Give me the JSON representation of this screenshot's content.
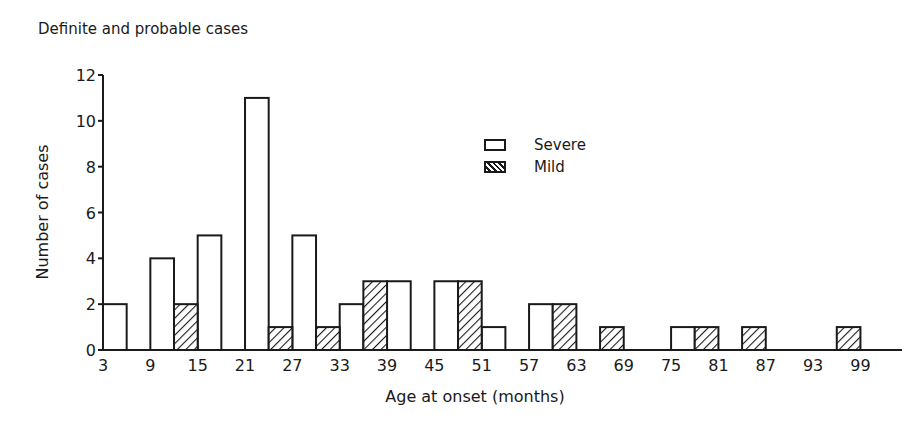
{
  "title": "Definite and probable cases",
  "chart_data": {
    "type": "bar",
    "title": "Definite and probable cases",
    "xlabel": "Age at onset (months)",
    "ylabel": "Number of cases",
    "ylim": [
      0,
      12
    ],
    "yticks": [
      0,
      2,
      4,
      6,
      8,
      10,
      12
    ],
    "xtick_labels": [
      "3",
      "9",
      "15",
      "21",
      "27",
      "33",
      "39",
      "45",
      "51",
      "57",
      "63",
      "69",
      "75",
      "81",
      "87",
      "93",
      "99"
    ],
    "grid": false,
    "legend_position": "upper-center-right",
    "bin_width_months": 3,
    "series": [
      {
        "name": "Severe",
        "pattern": "open",
        "bins": [
          {
            "age": 3,
            "value": 2
          },
          {
            "age": 9,
            "value": 4
          },
          {
            "age": 15,
            "value": 5
          },
          {
            "age": 21,
            "value": 11
          },
          {
            "age": 27,
            "value": 5
          },
          {
            "age": 33,
            "value": 2
          },
          {
            "age": 39,
            "value": 3
          },
          {
            "age": 45,
            "value": 3
          },
          {
            "age": 51,
            "value": 1
          },
          {
            "age": 57,
            "value": 2
          },
          {
            "age": 75,
            "value": 1
          }
        ]
      },
      {
        "name": "Mild",
        "pattern": "hatched",
        "bins": [
          {
            "age": 12,
            "value": 2
          },
          {
            "age": 24,
            "value": 1
          },
          {
            "age": 30,
            "value": 1
          },
          {
            "age": 36,
            "value": 3
          },
          {
            "age": 48,
            "value": 3
          },
          {
            "age": 60,
            "value": 2
          },
          {
            "age": 66,
            "value": 1
          },
          {
            "age": 78,
            "value": 1
          },
          {
            "age": 84,
            "value": 1
          },
          {
            "age": 96,
            "value": 1
          }
        ]
      }
    ]
  },
  "legend": {
    "severe": "Severe",
    "mild": "Mild"
  }
}
